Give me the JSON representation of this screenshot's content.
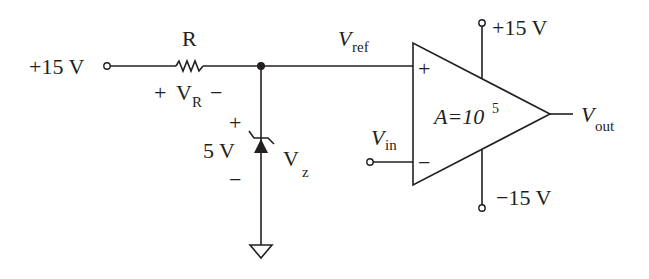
{
  "diagram": {
    "type": "op-amp comparator circuit with zener reference",
    "colors": {
      "ink": "#231f20",
      "background": "#ffffff"
    },
    "source": {
      "label": "+15 V"
    },
    "resistor": {
      "name": "R",
      "voltage_label_plus": "+",
      "voltage_label_v": "V",
      "voltage_label_sub": "R",
      "voltage_label_minus": "−"
    },
    "zener": {
      "voltage": "5 V",
      "plus": "+",
      "minus": "−",
      "label_v": "V",
      "label_sub": "z"
    },
    "vref": {
      "label_v": "V",
      "label_sub": "ref"
    },
    "vin": {
      "label_v": "V",
      "label_sub": "in"
    },
    "opamp": {
      "gain_prefix": "A=10",
      "gain_exp": "5",
      "plus_input": "+",
      "minus_input": "−",
      "supply_pos": "+15 V",
      "supply_neg": "−15 V"
    },
    "output": {
      "label_v": "V",
      "label_sub": "out"
    }
  }
}
